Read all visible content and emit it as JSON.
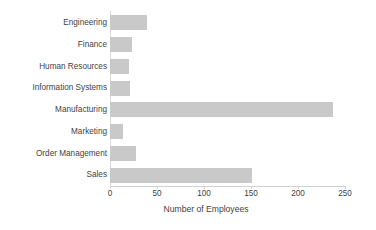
{
  "chart_data": {
    "type": "bar",
    "orientation": "horizontal",
    "title": "",
    "xlabel": "Number of Employees",
    "ylabel": "",
    "categories": [
      "Engineering",
      "Finance",
      "Human Resources",
      "Information Systems",
      "Manufacturing",
      "Marketing",
      "Order Management",
      "Sales"
    ],
    "values": [
      39,
      23,
      20,
      21,
      237,
      14,
      28,
      151
    ],
    "xlim": [
      0,
      250
    ],
    "xticks": [
      0,
      50,
      100,
      150,
      200,
      250
    ],
    "xtick_labels": [
      "0",
      "50",
      "100",
      "150",
      "200",
      "250"
    ],
    "grid": false,
    "legend": false,
    "bar_color": "#c9c9c9",
    "axis_color": "#d2d2d2",
    "text_color": "#3f3f3f",
    "background": "#ffffff"
  }
}
